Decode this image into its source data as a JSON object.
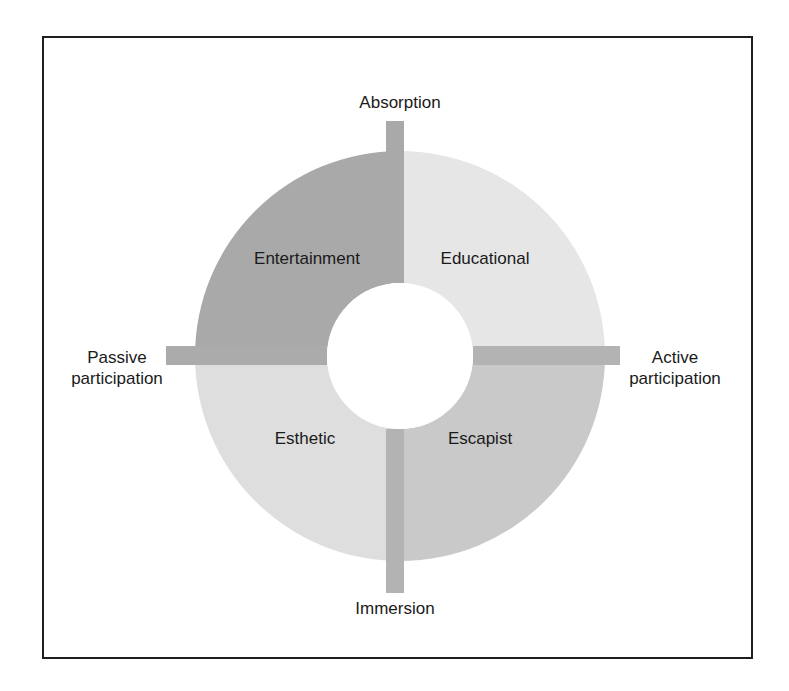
{
  "diagram": {
    "axes": {
      "top": "Absorption",
      "bottom": "Immersion",
      "left_line1": "Passive",
      "left_line2": "participation",
      "right_line1": "Active",
      "right_line2": "participation"
    },
    "quadrants": {
      "top_left": {
        "label": "Entertainment",
        "color": "#a9a9a9"
      },
      "top_right": {
        "label": "Educational",
        "color": "#e6e6e6"
      },
      "bottom_left": {
        "label": "Esthetic",
        "color": "#dedede"
      },
      "bottom_right": {
        "label": "Escapist",
        "color": "#c9c9c9"
      }
    },
    "axis_bar_color": "#b3b3b3",
    "frame_color": "#1e1e1e"
  }
}
